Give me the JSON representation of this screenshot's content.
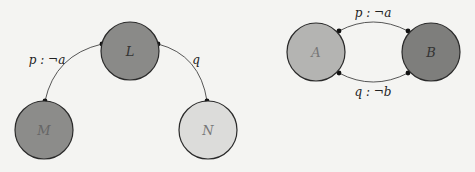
{
  "diagram_left": {
    "nodes": [
      {
        "id": "L",
        "label": "L",
        "cx": 130,
        "cy": 51,
        "r": 29,
        "fill": "#8a8a88"
      },
      {
        "id": "M",
        "label": "M",
        "cx": 44,
        "cy": 130,
        "r": 29,
        "fill": "#8c8c8a"
      },
      {
        "id": "N",
        "label": "N",
        "cx": 208,
        "cy": 130,
        "r": 29,
        "fill": "#dcdcda"
      }
    ],
    "edges": [
      {
        "from": "L",
        "to": "M",
        "label": "p : ¬a"
      },
      {
        "from": "L",
        "to": "N",
        "label": "q"
      }
    ]
  },
  "diagram_right": {
    "nodes": [
      {
        "id": "A",
        "label": "A",
        "cx": 316,
        "cy": 52,
        "r": 29,
        "fill": "#b4b4b2"
      },
      {
        "id": "B",
        "label": "B",
        "cx": 431,
        "cy": 52,
        "r": 29,
        "fill": "#7e7e7c"
      }
    ],
    "edges": [
      {
        "from": "A",
        "to": "B",
        "label": "p : ¬a",
        "position": "top"
      },
      {
        "from": "A",
        "to": "B",
        "label": "q : ¬b",
        "position": "bottom"
      }
    ]
  },
  "colors": {
    "background": "#f4f4f2",
    "stroke": "#2a2a2a",
    "node_text": "#555555"
  }
}
